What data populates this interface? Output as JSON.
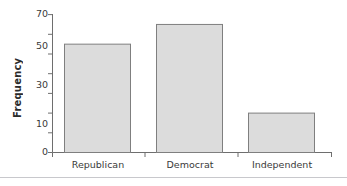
{
  "chart_data": {
    "type": "bar",
    "title": "",
    "xlabel": "",
    "ylabel": "Frequency",
    "categories": [
      "Republican",
      "Democrat",
      "Independent"
    ],
    "values": [
      55,
      65,
      20
    ],
    "ylim": [
      0,
      70
    ],
    "yticks": [
      0,
      10,
      20,
      30,
      40,
      50,
      60,
      70
    ],
    "ytick_labels": [
      "0",
      "10",
      "",
      "30",
      "",
      "50",
      "",
      "70"
    ],
    "grid": false,
    "legend": null,
    "series": [
      {
        "name": "Frequency",
        "values": [
          55,
          65,
          20
        ]
      }
    ],
    "annotations": []
  },
  "style": {
    "bar_fill": "#dcdcdc",
    "bar_border": "#7f7f7f",
    "axis_color": "#6e6e6e",
    "text_color": "#3a3a3a",
    "title_color": "#2b2b2b",
    "background": "#ffffff",
    "rule_color": "#c8c8cc"
  },
  "axis": {
    "y_title": "Frequency",
    "tick_0": "0",
    "tick_10": "10",
    "tick_30": "30",
    "tick_50": "50",
    "tick_70": "70"
  },
  "xaxis": {
    "cat_0": "Republican",
    "cat_1": "Democrat",
    "cat_2": "Independent"
  }
}
